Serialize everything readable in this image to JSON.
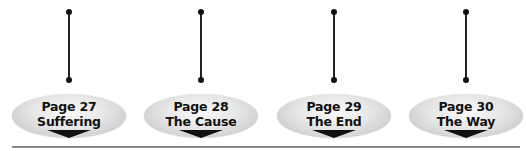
{
  "diagram": {
    "nodes": [
      {
        "page": "Page 27",
        "title": "Suffering",
        "x": 9
      },
      {
        "page": "Page 28",
        "title": "The Cause",
        "x": 141
      },
      {
        "page": "Page 29",
        "title": "The End",
        "x": 274
      },
      {
        "page": "Page 30",
        "title": "The Way",
        "x": 406
      }
    ]
  }
}
